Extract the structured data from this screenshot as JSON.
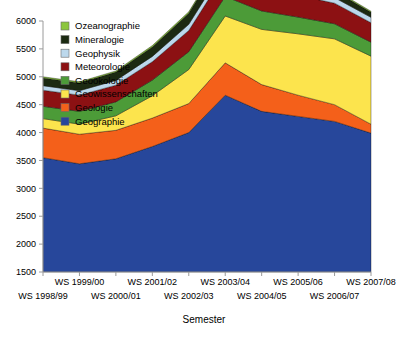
{
  "chart_data": {
    "type": "area",
    "stacked": true,
    "title": "",
    "xlabel": "Semester",
    "ylabel": "",
    "grid": false,
    "legend_position": "top-left-inside",
    "ylim": [
      1500,
      6000
    ],
    "ytick_step": 500,
    "yticks": [
      1500,
      2000,
      2500,
      3000,
      3500,
      4000,
      4500,
      5000,
      5500,
      6000
    ],
    "categories": [
      "WS 1998/99",
      "WS 1999/00",
      "WS 2000/01",
      "WS 2001/02",
      "WS 2002/03",
      "WS 2003/04",
      "WS 2004/05",
      "WS 2005/06",
      "WS 2006/07",
      "WS 2007/08"
    ],
    "stack_order_bottom_to_top": [
      "Geographie",
      "Geologie",
      "Geowissenschaften",
      "Geoökologie",
      "Meteorologie",
      "Geophysik",
      "Mineralogie",
      "Ozeanographie"
    ],
    "series": [
      {
        "name": "Geographie",
        "color": "#27479b",
        "values": [
          2050,
          1940,
          2030,
          2250,
          2500,
          3170,
          2880,
          2790,
          2700,
          2490
        ]
      },
      {
        "name": "Geologie",
        "color": "#f4601a",
        "values": [
          530,
          530,
          510,
          510,
          520,
          580,
          480,
          380,
          300,
          160
        ]
      },
      {
        "name": "Geowissenschaften",
        "color": "#fce44d",
        "values": [
          170,
          180,
          260,
          400,
          610,
          840,
          990,
          1100,
          1180,
          1220
        ]
      },
      {
        "name": "Geoökologie",
        "color": "#4c9b38",
        "values": [
          220,
          230,
          250,
          280,
          320,
          350,
          330,
          300,
          270,
          250
        ]
      },
      {
        "name": "Meteorologie",
        "color": "#8c1113",
        "values": [
          290,
          290,
          300,
          330,
          380,
          420,
          400,
          390,
          370,
          350
        ]
      },
      {
        "name": "Geophysik",
        "color": "#bcd8ec",
        "values": [
          80,
          80,
          85,
          95,
          110,
          120,
          115,
          110,
          100,
          95
        ]
      },
      {
        "name": "Mineralogie",
        "color": "#1c2a12",
        "values": [
          140,
          140,
          150,
          170,
          200,
          220,
          200,
          160,
          120,
          90
        ]
      },
      {
        "name": "Ozeanographie",
        "color": "#8cc63e",
        "values": [
          20,
          20,
          20,
          25,
          25,
          30,
          25,
          25,
          20,
          20
        ]
      }
    ],
    "stack_totals": [
      3500,
      3410,
      3605,
      4060,
      4665,
      5730,
      5420,
      5255,
      5060,
      4675
    ]
  },
  "legend": {
    "items": [
      {
        "label": "Ozeanographie",
        "color": "#8cc63e"
      },
      {
        "label": "Mineralogie",
        "color": "#1c2a12"
      },
      {
        "label": "Geophysik",
        "color": "#bcd8ec"
      },
      {
        "label": "Meteorologie",
        "color": "#8c1113"
      },
      {
        "label": "Geoökologie",
        "color": "#4c9b38"
      },
      {
        "label": "Geowissenschaften",
        "color": "#fce44d"
      },
      {
        "label": "Geologie",
        "color": "#f4601a"
      },
      {
        "label": "Geographie",
        "color": "#27479b"
      }
    ]
  },
  "axes": {
    "x_title": "Semester",
    "y_tick_labels": [
      "6000",
      "5500",
      "5000",
      "4500",
      "4000",
      "3500",
      "3000",
      "2500",
      "2000",
      "1500"
    ],
    "x_tick_labels_upper_row": [
      "WS 1999/00",
      "WS 2001/02",
      "WS 2003/04",
      "WS 2005/06",
      "WS 2007/08"
    ],
    "x_tick_labels_lower_row": [
      "WS 1998/99",
      "WS 2000/01",
      "WS 2002/03",
      "WS 2004/05",
      "WS 2006/07"
    ]
  },
  "style": {
    "background": "#ffffff",
    "axis_color": "#9a9a9a",
    "text_color": "#000000"
  }
}
